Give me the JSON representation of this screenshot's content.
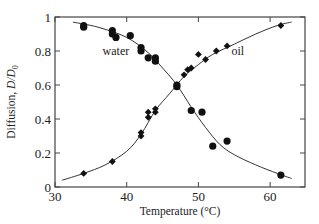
{
  "chart_data": {
    "type": "scatter",
    "title": "",
    "xlabel": "Temperature (°C)",
    "ylabel": "Diffusion, D/D0",
    "ylabel_parts": {
      "prefix": "Diffusion, ",
      "var": "D/D",
      "sub": "0"
    },
    "xlim": [
      30,
      65
    ],
    "ylim": [
      0,
      1
    ],
    "xticks": [
      30,
      40,
      50,
      60
    ],
    "yticks": [
      0,
      0.2,
      0.4,
      0.6,
      0.8,
      1
    ],
    "ytick_labels": [
      "0",
      "0.2",
      "0.4",
      "0.6",
      "0.8",
      "1"
    ],
    "xtick_labels": [
      "30",
      "40",
      "50",
      "60"
    ],
    "grid": false,
    "legend": "inline labels",
    "annotations": [
      {
        "text": "water",
        "x": 38.5,
        "y": 0.8
      },
      {
        "text": "oil",
        "x": 55.5,
        "y": 0.8
      }
    ],
    "series": [
      {
        "name": "water",
        "marker": "circle",
        "color": "#111111",
        "points": [
          [
            34,
            0.95
          ],
          [
            34,
            0.94
          ],
          [
            38,
            0.92
          ],
          [
            38,
            0.9
          ],
          [
            38.5,
            0.88
          ],
          [
            40.5,
            0.89
          ],
          [
            42,
            0.82
          ],
          [
            42,
            0.8
          ],
          [
            43,
            0.76
          ],
          [
            44,
            0.76
          ],
          [
            44,
            0.74
          ],
          [
            47,
            0.59
          ],
          [
            47,
            0.6
          ],
          [
            49,
            0.45
          ],
          [
            50.5,
            0.44
          ],
          [
            52,
            0.24
          ],
          [
            54,
            0.27
          ],
          [
            61.5,
            0.07
          ]
        ],
        "fit_curve": [
          [
            32.5,
            0.97
          ],
          [
            36,
            0.94
          ],
          [
            40,
            0.88
          ],
          [
            43,
            0.79
          ],
          [
            45,
            0.7
          ],
          [
            47,
            0.6
          ],
          [
            49,
            0.47
          ],
          [
            51,
            0.35
          ],
          [
            53,
            0.25
          ],
          [
            55,
            0.19
          ],
          [
            58,
            0.13
          ],
          [
            61,
            0.08
          ],
          [
            63,
            0.05
          ]
        ]
      },
      {
        "name": "oil",
        "marker": "diamond",
        "color": "#111111",
        "points": [
          [
            34,
            0.08
          ],
          [
            38,
            0.15
          ],
          [
            42,
            0.3
          ],
          [
            42,
            0.32
          ],
          [
            43,
            0.41
          ],
          [
            43,
            0.44
          ],
          [
            44,
            0.44
          ],
          [
            44,
            0.46
          ],
          [
            47,
            0.59
          ],
          [
            47,
            0.6
          ],
          [
            48,
            0.66
          ],
          [
            48.5,
            0.69
          ],
          [
            49,
            0.7
          ],
          [
            50,
            0.78
          ],
          [
            51,
            0.75
          ],
          [
            52.5,
            0.8
          ],
          [
            54,
            0.83
          ],
          [
            61.5,
            0.95
          ]
        ],
        "fit_curve": [
          [
            31,
            0.04
          ],
          [
            34,
            0.08
          ],
          [
            37,
            0.13
          ],
          [
            40,
            0.21
          ],
          [
            42,
            0.31
          ],
          [
            44,
            0.45
          ],
          [
            46,
            0.55
          ],
          [
            48,
            0.65
          ],
          [
            50,
            0.72
          ],
          [
            52,
            0.78
          ],
          [
            55,
            0.84
          ],
          [
            58,
            0.9
          ],
          [
            61,
            0.95
          ],
          [
            63,
            0.97
          ]
        ]
      }
    ]
  }
}
